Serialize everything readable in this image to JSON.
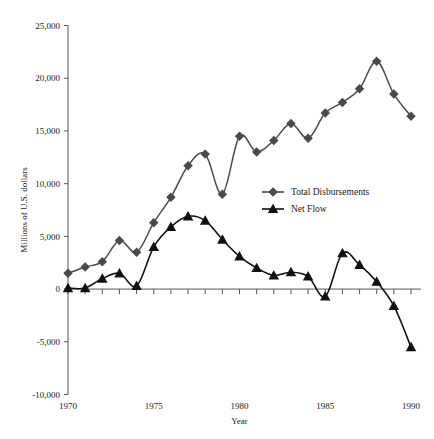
{
  "chart_data": {
    "type": "line",
    "title": "",
    "xlabel": "Year",
    "ylabel": "Millions of U.S. dollars",
    "xlim": [
      1969.4,
      1990.6
    ],
    "ylim": [
      -10000,
      25000
    ],
    "grid": false,
    "legend_position": "center-right",
    "x_ticks_labeled": [
      "1970",
      "1975",
      "1980",
      "1985",
      "1990"
    ],
    "x_tick_values": [
      1970,
      1975,
      1980,
      1985,
      1990
    ],
    "y_ticks_labeled": [
      "25,000",
      "20,000",
      "15,000",
      "10,000",
      "5,000",
      "0",
      "-5,000",
      "-10,000"
    ],
    "y_tick_values": [
      25000,
      20000,
      15000,
      10000,
      5000,
      0,
      -5000,
      -10000
    ],
    "x": [
      1970,
      1971,
      1972,
      1973,
      1974,
      1975,
      1976,
      1977,
      1978,
      1979,
      1980,
      1981,
      1982,
      1983,
      1984,
      1985,
      1986,
      1987,
      1988,
      1989,
      1990
    ],
    "series": [
      {
        "name": "Total Disbursements",
        "marker": "diamond",
        "color": "#4a4a4a",
        "values": [
          1500,
          2100,
          2600,
          4600,
          3500,
          6300,
          8700,
          11700,
          12800,
          9000,
          14500,
          13000,
          14100,
          15700,
          14300,
          16700,
          17700,
          19000,
          21600,
          18500,
          16400
        ]
      },
      {
        "name": "Net Flow",
        "marker": "triangle",
        "color": "#111111",
        "values": [
          100,
          100,
          1000,
          1500,
          300,
          4000,
          5900,
          6900,
          6500,
          4700,
          3100,
          2000,
          1300,
          1600,
          1200,
          -700,
          3400,
          2300,
          700,
          -1600,
          -5500
        ]
      }
    ]
  },
  "legend": {
    "items": [
      {
        "label": "Total Disbursements",
        "marker": "diamond"
      },
      {
        "label": "Net Flow",
        "marker": "triangle"
      }
    ]
  },
  "axes": {
    "y_title": "Millions of U.S. dollars",
    "x_title": "Year"
  }
}
